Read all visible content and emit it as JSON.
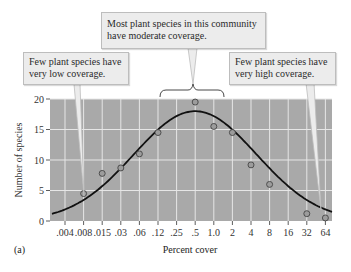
{
  "figure_label": "(a)",
  "callouts": {
    "low": {
      "line1": "Few plant species have",
      "line2": "very low coverage."
    },
    "mid": {
      "line1": "Most plant species in this community",
      "line2": "have moderate coverage."
    },
    "high": {
      "line1": "Few plant species have",
      "line2": "very high coverage."
    }
  },
  "colors": {
    "plot_bg": "#a9a9a9",
    "grid": "#e6e6e6",
    "curve": "#111111",
    "callout_bg": "#ececec"
  },
  "chart_data": {
    "type": "scatter",
    "title": "",
    "xlabel": "Percent cover",
    "ylabel": "Number of species",
    "x_scale": "log2 (categorical ticks)",
    "categories": [
      ".004",
      ".008",
      ".015",
      ".03",
      ".06",
      ".12",
      ".25",
      ".5",
      "1.0",
      "2",
      "4",
      "8",
      "16",
      "32",
      "64"
    ],
    "yticks": [
      0,
      5,
      10,
      15,
      20
    ],
    "ylim": [
      0,
      20
    ],
    "grid": true,
    "series": [
      {
        "name": "Observed species counts",
        "marker": "open circle",
        "points": [
          {
            "x": ".008",
            "y": 4.5
          },
          {
            "x": ".015",
            "y": 7.8
          },
          {
            "x": ".03",
            "y": 8.7
          },
          {
            "x": ".06",
            "y": 11
          },
          {
            "x": ".12",
            "y": 14.5
          },
          {
            "x": ".5",
            "y": 19.5
          },
          {
            "x": "1.0",
            "y": 15.5
          },
          {
            "x": "2",
            "y": 14.5
          },
          {
            "x": "4",
            "y": 9.2
          },
          {
            "x": "8",
            "y": 6
          },
          {
            "x": "32",
            "y": 1.2
          },
          {
            "x": "64",
            "y": 0.5
          }
        ]
      },
      {
        "name": "Fitted lognormal curve",
        "style": "line",
        "peak": {
          "x": ".5",
          "y": 18
        }
      }
    ],
    "annotations": [
      "Few plant species have very low coverage.",
      "Most plant species in this community have moderate coverage.",
      "Few plant species have very high coverage."
    ]
  }
}
